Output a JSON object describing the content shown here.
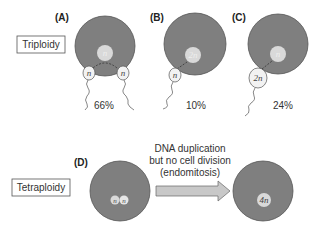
{
  "rows": {
    "triploidy": {
      "label": "Triploidy"
    },
    "tetraploidy": {
      "label": "Tetraploidy"
    }
  },
  "panels": {
    "A": {
      "label": "(A)",
      "egg_nucleus": "n",
      "sperm": [
        "n",
        "n"
      ],
      "percent": "66%"
    },
    "B": {
      "label": "(B)",
      "egg_nucleus": "2n",
      "sperm": [
        "n"
      ],
      "percent": "10%"
    },
    "C": {
      "label": "(C)",
      "egg_nucleus": "n",
      "sperm": [
        "2n"
      ],
      "percent": "24%"
    },
    "D": {
      "label": "(D)",
      "nuclei_before": [
        "n",
        "n"
      ],
      "nucleus_after": "4n"
    }
  },
  "arrow": {
    "line1": "DNA duplication",
    "line2": "but no cell division",
    "line3": "(endomitosis)"
  },
  "colors": {
    "cell_fill": "#7f7f7f",
    "cell_stroke": "#555555",
    "nucleus_fill": "#d9d9d9",
    "sperm_fill": "#f2f2f2",
    "arrow_fill": "#c8c8c8"
  }
}
